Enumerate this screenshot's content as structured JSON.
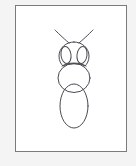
{
  "page": {
    "background_color": "#f4f4f4",
    "width": 136,
    "height": 166
  },
  "canvas": {
    "label": "drawing-canvas",
    "background_color": "#ffffff",
    "border_color": "#7b7b7b",
    "x": 15,
    "y": 5,
    "width": 112,
    "height": 147
  },
  "drawing": {
    "subject": "insect-line-drawing",
    "stroke_color": "#4a4a52",
    "stroke_width": 1,
    "fill": "none",
    "parts": [
      {
        "name": "antenna-left",
        "type": "path",
        "d": "M 53 37 C 46 31 41 26 39 24"
      },
      {
        "name": "antenna-right",
        "type": "path",
        "d": "M 63 37 C 70 31 75 26 77 24"
      },
      {
        "name": "head",
        "type": "path",
        "d": "M 58 36 C 50 36 43 42 43 50 C 43 55 45 58 47 60 C 52 57 64 57 69 60 C 71 58 73 55 73 50 C 73 42 66 36 58 36 Z"
      },
      {
        "name": "head-chin-line",
        "type": "path",
        "d": "M 46 60 C 52 56 64 56 70 60"
      },
      {
        "name": "eye-left",
        "type": "ellipse",
        "cx": 50,
        "cy": 49,
        "rx": 5,
        "ry": 8.5,
        "rotate": -8
      },
      {
        "name": "eye-right",
        "type": "ellipse",
        "cx": 66,
        "cy": 49,
        "rx": 5,
        "ry": 8.5,
        "rotate": 8
      },
      {
        "name": "thorax",
        "type": "ellipse",
        "cx": 58,
        "cy": 72,
        "rx": 16,
        "ry": 14.5,
        "rotate": 0
      },
      {
        "name": "abdomen",
        "type": "ellipse",
        "cx": 58,
        "cy": 100,
        "rx": 14,
        "ry": 22,
        "rotate": 0
      }
    ]
  }
}
